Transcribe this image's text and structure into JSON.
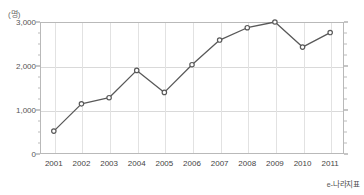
{
  "chart_data": {
    "type": "line",
    "title": "",
    "subtitle": "",
    "xlabel": "",
    "ylabel": "",
    "yunit": "(명)",
    "categories": [
      "2001",
      "2002",
      "2003",
      "2004",
      "2005",
      "2006",
      "2007",
      "2008",
      "2009",
      "2010",
      "2011"
    ],
    "values": [
      520,
      1140,
      1280,
      1900,
      1400,
      2030,
      2590,
      2870,
      3000,
      2430,
      2760
    ],
    "series": [
      {
        "name": "",
        "values": [
          520,
          1140,
          1280,
          1900,
          1400,
          2030,
          2590,
          2870,
          3000,
          2430,
          2760
        ]
      }
    ],
    "ylim": [
      0,
      3000
    ],
    "yticks": [
      0,
      1000,
      2000,
      3000
    ],
    "ytick_labels": [
      "0",
      "1,000",
      "2,000",
      "3,000"
    ],
    "grid": true,
    "legend": "none",
    "line_color": "#595959",
    "marker_color": "#595959",
    "marker_fill": "#ffffff",
    "marker_shape": "circle",
    "grid_color": "#d9d9d9",
    "frame_color": "#b9b9b9"
  },
  "footer": {
    "watermark_mark": "e",
    "watermark_text": "-나라지표"
  }
}
